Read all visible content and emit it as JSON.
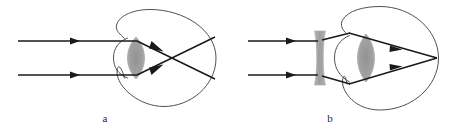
{
  "figure": {
    "width": 462,
    "height": 135,
    "background_color": "#ffffff",
    "stroke_color": "#1a1a1a",
    "outline_color": "#3a3a3a",
    "lens_fill_color": "#9a9a9a",
    "label_color": "#2b2b2b"
  },
  "panels": [
    {
      "id": "a",
      "label": "a",
      "label_x": 105,
      "label_y": 122,
      "caption_semantic": "uncorrected myopic eye - parallel rays focus in front of the retina",
      "eye": {
        "center_x": 170,
        "center_y": 58,
        "radius_x": 46,
        "radius_y": 48,
        "cornea_bulge_x": 118,
        "cornea_top_y": 38,
        "cornea_bottom_y": 78
      },
      "lens": {
        "type": "biconvex",
        "center_x": 136,
        "center_y": 58,
        "half_width": 8,
        "half_height": 21,
        "fill": "#9a9a9a"
      },
      "incoming_rays": [
        {
          "name": "upper-ray",
          "x1": 18,
          "y1": 41,
          "x2": 136,
          "y2": 41,
          "arrow_at_x": 77
        },
        {
          "name": "lower-ray",
          "x1": 18,
          "y1": 75,
          "x2": 136,
          "y2": 75,
          "arrow_at_x": 77
        }
      ],
      "refracted_rays": [
        {
          "name": "upper-refracted-ray",
          "x1": 136,
          "y1": 41,
          "x2": 216,
          "y2": 80,
          "arrow_t": 0.33
        },
        {
          "name": "lower-refracted-ray",
          "x1": 136,
          "y1": 75,
          "x2": 216,
          "y2": 36,
          "arrow_t": 0.33
        }
      ],
      "focal_point": {
        "x": 182,
        "y": 58,
        "note": "rays cross in front of retina"
      }
    },
    {
      "id": "b",
      "label": "b",
      "label_x": 330,
      "label_y": 122,
      "caption_semantic": "myopic eye corrected by a diverging (concave) lens - rays focus on the retina",
      "eye": {
        "center_x": 392,
        "center_y": 58,
        "radius_x": 46,
        "radius_y": 48,
        "cornea_bulge_x": 340,
        "cornea_top_y": 38,
        "cornea_bottom_y": 78
      },
      "eye_lens": {
        "type": "biconvex",
        "center_x": 366,
        "center_y": 58,
        "half_width": 8,
        "half_height": 22,
        "fill": "#9a9a9a"
      },
      "corrective_lens": {
        "type": "biconcave",
        "center_x": 320,
        "center_y": 58,
        "half_width": 5,
        "half_height": 26,
        "waist_half_width": 3,
        "fill": "#9a9a9a"
      },
      "incoming_rays": [
        {
          "name": "upper-ray",
          "x1": 248,
          "y1": 41,
          "x2": 316,
          "y2": 41,
          "arrow_at_x": 293
        },
        {
          "name": "lower-ray",
          "x1": 248,
          "y1": 75,
          "x2": 316,
          "y2": 75,
          "arrow_at_x": 293
        }
      ],
      "diverged_rays": [
        {
          "name": "upper-diverged-ray",
          "x1": 324,
          "y1": 40,
          "x2": 347,
          "y2": 33
        },
        {
          "name": "lower-diverged-ray",
          "x1": 324,
          "y1": 76,
          "x2": 347,
          "y2": 84
        }
      ],
      "refracted_rays": [
        {
          "name": "upper-refracted-ray",
          "x1": 347,
          "y1": 33,
          "x2": 436,
          "y2": 58,
          "arrow_t": 0.62
        },
        {
          "name": "lower-refracted-ray",
          "x1": 347,
          "y1": 84,
          "x2": 436,
          "y2": 58,
          "arrow_t": 0.62
        }
      ],
      "focal_point": {
        "x": 436,
        "y": 58,
        "note": "rays focus on the retina"
      }
    }
  ]
}
